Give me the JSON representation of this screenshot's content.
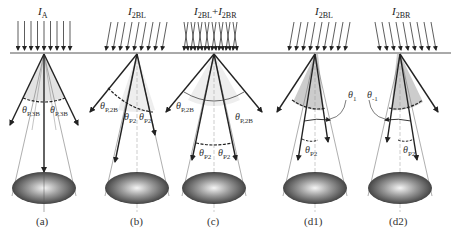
{
  "figure": {
    "baseline_y": 53,
    "panels": [
      {
        "id": "a",
        "caption": "(a)",
        "title_main": "I",
        "title_sub": "A",
        "title_sub2": "",
        "title_plus": "",
        "incident": "normal",
        "apex_x": 44,
        "angle_labels": [
          "θP,3B",
          "θP,3B"
        ],
        "theta_left_sub": "P,3B",
        "theta_right_sub": "P,3B"
      },
      {
        "id": "b",
        "caption": "(b)",
        "title_main": "I",
        "title_sub": "2BL",
        "incident": "left",
        "apex_x": 137,
        "theta_outer_sub": "P,2B",
        "theta_inner_sub1": "P2",
        "theta_inner_sub2": "P2"
      },
      {
        "id": "c",
        "caption": "(c)",
        "title_main": "I",
        "title_sub": "2BL",
        "title_plus": "+",
        "title_main2": "I",
        "title_sub2": "2BR",
        "incident": "both",
        "apex_x": 214,
        "theta_outer_left_sub": "P,2B",
        "theta_outer_right_sub": "P,2B",
        "theta_inner_left_sub": "P2",
        "theta_inner_right_sub": "P2"
      },
      {
        "id": "d1",
        "caption": "(d1)",
        "title_main": "I",
        "title_sub": "2BL",
        "incident": "left",
        "apex_x": 315,
        "theta_tilt_sub": "1",
        "theta_inner_sub": "P2"
      },
      {
        "id": "d2",
        "caption": "(d2)",
        "title_main": "I",
        "title_sub": "2BR",
        "incident": "right",
        "apex_x": 400,
        "theta_tilt_sub": "-1",
        "theta_inner_sub": "P2"
      }
    ],
    "theta_symbol": "θ",
    "colors": {
      "line": "#222222",
      "thin_line": "#666666",
      "cone_fill": "#d9d9d9",
      "ellipse_dark": "#3a3a3a",
      "ellipse_light": "#f2f2f2"
    }
  }
}
